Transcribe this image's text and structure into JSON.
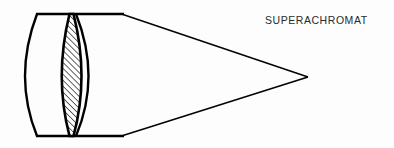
{
  "figure": {
    "label": "SUPERACHROMAT",
    "background_color": "#fdfdfd",
    "stroke_color": "#000000",
    "hatch_color": "#1a1a1a",
    "width": 394,
    "height": 148
  },
  "diagram_data": {
    "type": "optical-lens-schematic",
    "title": "SUPERACHROMAT",
    "description": "Cross-section schematic of a superachromat lens assembly with three cemented elements and a converging ray cone to a focal point.",
    "axis": {
      "optical_axis_y": 77
    },
    "assembly": {
      "top_edge_y": 14,
      "bottom_edge_y": 136,
      "left_x": 37,
      "right_x": 123,
      "aperture_height": 122
    },
    "elements": [
      {
        "index": 1,
        "name": "front-positive-meniscus",
        "fill": "none",
        "hatched": false,
        "front_surface": "convex",
        "rear_surface": "convex",
        "front_vertex_x": 14,
        "rear_vertex_x": 70,
        "edge_left_x": 37,
        "edge_right_x": 64
      },
      {
        "index": 2,
        "name": "center-biconvex-crown",
        "fill": "hatched",
        "hatched": true,
        "hatch_angle_deg": 45,
        "hatch_spacing_px": 3,
        "front_surface": "convex",
        "rear_surface": "convex",
        "front_vertex_x": 55,
        "rear_vertex_x": 90,
        "edge_left_x": 69,
        "edge_right_x": 74
      },
      {
        "index": 3,
        "name": "rear-negative-meniscus",
        "fill": "none",
        "hatched": false,
        "front_surface": "concave",
        "rear_surface": "plano",
        "front_vertex_x": 101,
        "rear_vertex_x": 123,
        "edge_left_x": 76,
        "edge_right_x": 123
      }
    ],
    "ray_cone": {
      "name": "converging-ray-cone",
      "upper_ray": {
        "from": [
          123,
          14
        ],
        "to": [
          308,
          77
        ]
      },
      "lower_ray": {
        "from": [
          123,
          136
        ],
        "to": [
          308,
          77
        ]
      },
      "focal_point": [
        308,
        77
      ]
    }
  }
}
